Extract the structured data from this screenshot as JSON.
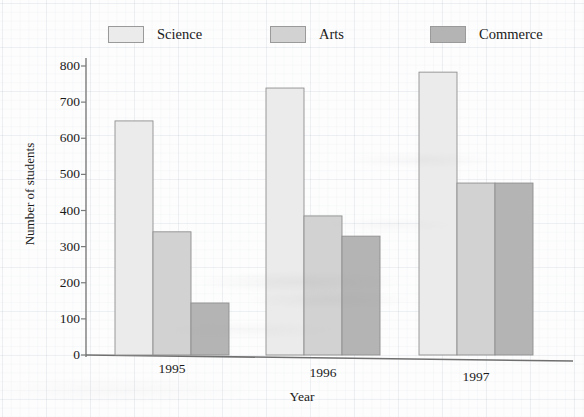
{
  "chart_data": {
    "type": "bar",
    "title": "",
    "xlabel": "Year",
    "ylabel": "Number of students",
    "categories": [
      "1995",
      "1996",
      "1997"
    ],
    "series": [
      {
        "name": "Science",
        "color": "#ebebeb",
        "values": [
          648,
          739,
          783
        ]
      },
      {
        "name": "Arts",
        "color": "#d2d2d2",
        "values": [
          341,
          385,
          476
        ]
      },
      {
        "name": "Commerce",
        "color": "#b4b4b4",
        "values": [
          144,
          329,
          476
        ]
      }
    ],
    "ylim": [
      0,
      800
    ],
    "yticks": [
      0,
      100,
      200,
      300,
      400,
      500,
      600,
      700,
      800
    ],
    "ytick_labels": [
      "0",
      "100",
      "200",
      "300",
      "400",
      "500",
      "600",
      "700",
      "800"
    ],
    "grid": false,
    "legend_position": "top",
    "bar_outline_color": "#8f8f8f",
    "axis_color": "#7a7a7a"
  },
  "legend": {
    "items": [
      {
        "label": "Science"
      },
      {
        "label": "Arts"
      },
      {
        "label": "Commerce"
      }
    ]
  },
  "axes": {
    "y_title": "Number of students",
    "x_title": "Year",
    "y_ticks": [
      "800",
      "700",
      "600",
      "500",
      "400",
      "300",
      "200",
      "100",
      "0"
    ],
    "x_ticks": [
      "1995",
      "1996",
      "1997"
    ]
  }
}
